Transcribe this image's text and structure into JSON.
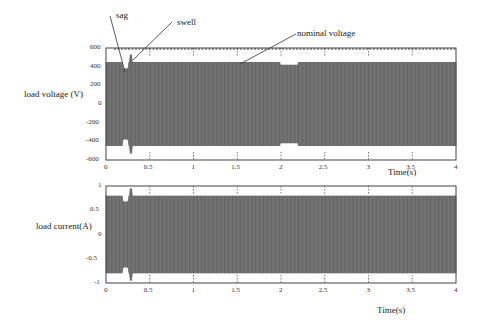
{
  "chart_data": [
    {
      "type": "line",
      "title": "",
      "ylabel": "load voltage (V)",
      "xlabel": "Time(s)",
      "xlim": [
        0,
        4
      ],
      "ylim": [
        -600,
        600
      ],
      "xticks": [
        "0",
        "0.5",
        "1",
        "1.5",
        "2",
        "2.5",
        "3",
        "3.5",
        "4"
      ],
      "yticks": [
        "600",
        "400",
        "200",
        "0",
        "-200",
        "-400",
        "-600"
      ],
      "grid": "dotted vertical at x ticks",
      "series": [
        {
          "name": "load voltage",
          "description": "dense sinusoid, amplitude ~450 V",
          "envelope": [
            {
              "t": 0.0,
              "amp": 450
            },
            {
              "t": 0.2,
              "amp": 380
            },
            {
              "t": 0.25,
              "amp": 450
            },
            {
              "t": 0.27,
              "amp": 530
            },
            {
              "t": 0.3,
              "amp": 450
            },
            {
              "t": 1.8,
              "amp": 450
            },
            {
              "t": 2.0,
              "amp": 420
            },
            {
              "t": 2.2,
              "amp": 450
            },
            {
              "t": 4.0,
              "amp": 450
            }
          ]
        },
        {
          "name": "nominal voltage",
          "style": "dashed",
          "value": 600
        }
      ],
      "annotations": [
        "sag",
        "swell",
        "nominal voltage"
      ]
    },
    {
      "type": "line",
      "title": "",
      "ylabel": "load current(A)",
      "xlabel": "Time(s)",
      "xlim": [
        0,
        4
      ],
      "ylim": [
        -1,
        1
      ],
      "xticks": [
        "0",
        "0.5",
        "1",
        "1.5",
        "2",
        "2.5",
        "3",
        "3.5",
        "4"
      ],
      "yticks": [
        "1",
        "0.5",
        "0",
        "-0.5",
        "-1"
      ],
      "grid": "dotted vertical at x ticks",
      "series": [
        {
          "name": "load current",
          "description": "dense sinusoid, amplitude ~0.8 A",
          "envelope": [
            {
              "t": 0.0,
              "amp": 0.8
            },
            {
              "t": 0.2,
              "amp": 0.68
            },
            {
              "t": 0.25,
              "amp": 0.8
            },
            {
              "t": 0.27,
              "amp": 0.95
            },
            {
              "t": 0.3,
              "amp": 0.8
            },
            {
              "t": 4.0,
              "amp": 0.8
            }
          ]
        }
      ]
    }
  ],
  "labels": {
    "top_ylabel": "load voltage (V)",
    "bottom_ylabel": "load current(A)",
    "top_xlabel": "Time(s)",
    "bottom_xlabel": "Time(s)",
    "sag": "sag",
    "swell": "swell",
    "nominal": "nominal voltage"
  },
  "top_yticks": [
    "600",
    "400",
    "200",
    "0",
    "-200",
    "-400",
    "-600"
  ],
  "bottom_yticks": [
    "1",
    "0.5",
    "0",
    "-0.5",
    "-1"
  ],
  "xticks": [
    "0",
    "0.5",
    "1",
    "1.5",
    "2",
    "2.5",
    "3",
    "3.5",
    "4"
  ]
}
